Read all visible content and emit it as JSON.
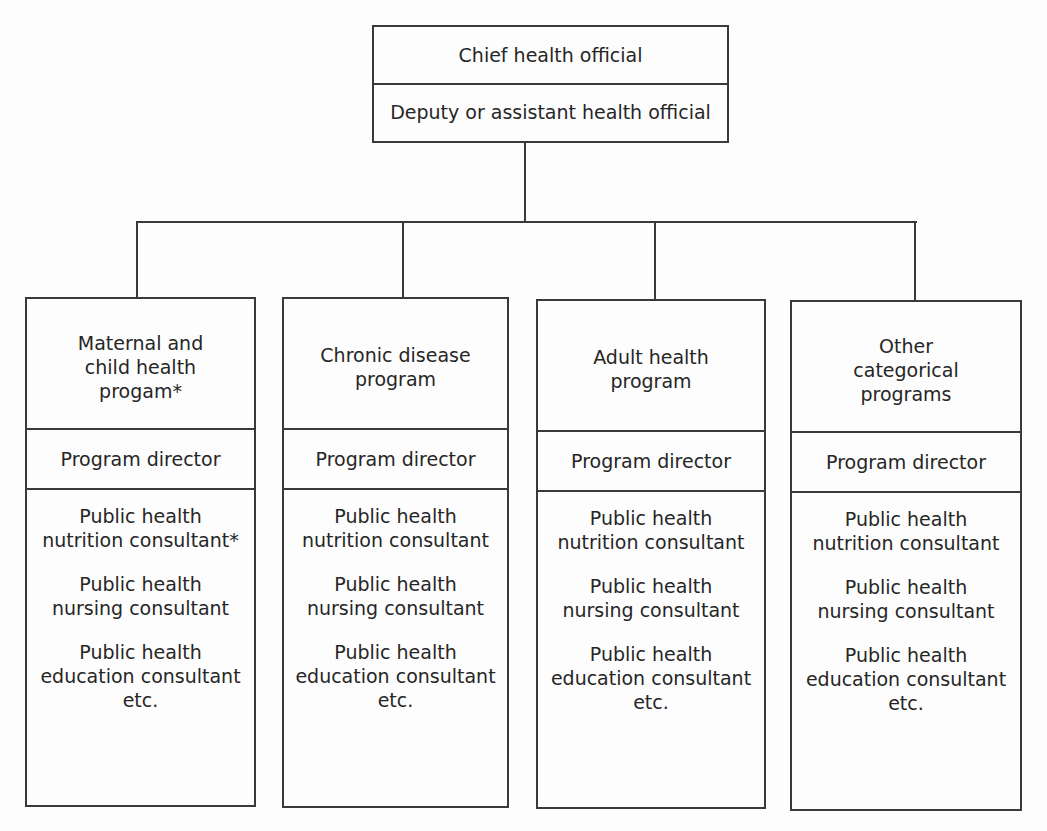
{
  "top": {
    "chief": "Chief health official",
    "deputy": "Deputy or assistant health official"
  },
  "columns": [
    {
      "program": [
        "Maternal and",
        "child health",
        "progam*"
      ],
      "director": "Program director",
      "staff": [
        [
          "Public health",
          "nutrition consultant*"
        ],
        [
          "Public health",
          "nursing consultant"
        ],
        [
          "Public health",
          "education consultant",
          "etc."
        ]
      ]
    },
    {
      "program": [
        "Chronic disease",
        "program"
      ],
      "director": "Program director",
      "staff": [
        [
          "Public health",
          "nutrition consultant"
        ],
        [
          "Public health",
          "nursing consultant"
        ],
        [
          "Public health",
          "education consultant",
          "etc."
        ]
      ]
    },
    {
      "program": [
        "Adult health",
        "program"
      ],
      "director": "Program director",
      "staff": [
        [
          "Public health",
          "nutrition consultant"
        ],
        [
          "Public health",
          "nursing consultant"
        ],
        [
          "Public health",
          "education consultant",
          "etc."
        ]
      ]
    },
    {
      "program": [
        "Other",
        "categorical",
        "programs"
      ],
      "director": "Program director",
      "staff": [
        [
          "Public health",
          "nutrition consultant"
        ],
        [
          "Public health",
          "nursing consultant"
        ],
        [
          "Public health",
          "education consultant",
          "etc."
        ]
      ]
    }
  ]
}
